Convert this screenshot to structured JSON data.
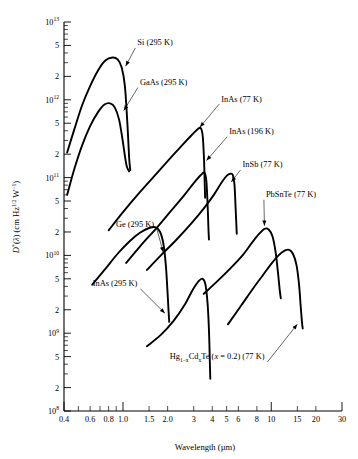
{
  "chart_data": {
    "type": "line",
    "title": "",
    "xlabel": "Wavelength (µm)",
    "ylabel": "D*(λ) (cm Hz^1/2 W^−1)",
    "xscale": "log",
    "yscale": "log",
    "xlim": [
      0.4,
      30
    ],
    "ylim": [
      100000000.0,
      10000000000000.0
    ],
    "grid": false,
    "legend_position": "inline-annotations",
    "xticks": [
      {
        "value": 0.4,
        "label": "0.4",
        "major": true
      },
      {
        "value": 0.5,
        "label": "",
        "major": false
      },
      {
        "value": 0.6,
        "label": "0.6",
        "major": true
      },
      {
        "value": 0.7,
        "label": "",
        "major": false
      },
      {
        "value": 0.8,
        "label": "0.8",
        "major": true
      },
      {
        "value": 0.9,
        "label": "",
        "major": false
      },
      {
        "value": 1.0,
        "label": "1.0",
        "major": true
      },
      {
        "value": 1.5,
        "label": "1.5",
        "major": true
      },
      {
        "value": 2.0,
        "label": "2.0",
        "major": true
      },
      {
        "value": 3,
        "label": "3",
        "major": true
      },
      {
        "value": 4,
        "label": "4",
        "major": true
      },
      {
        "value": 5,
        "label": "5",
        "major": true
      },
      {
        "value": 6,
        "label": "6",
        "major": true
      },
      {
        "value": 8,
        "label": "8",
        "major": true
      },
      {
        "value": 10,
        "label": "10",
        "major": true
      },
      {
        "value": 15,
        "label": "15",
        "major": true
      },
      {
        "value": 20,
        "label": "20",
        "major": true
      },
      {
        "value": 30,
        "label": "30",
        "major": true
      }
    ],
    "yticks": [
      {
        "value": 10000000000000.0,
        "label": "10¹³",
        "mantissa": "10",
        "exponent": "13",
        "major": true
      },
      {
        "value": 5000000000000.0,
        "label": "5",
        "major": true
      },
      {
        "value": 2000000000000.0,
        "label": "2",
        "major": true
      },
      {
        "value": 1000000000000.0,
        "label": "10¹²",
        "mantissa": "10",
        "exponent": "12",
        "major": true
      },
      {
        "value": 500000000000.0,
        "label": "5",
        "major": true
      },
      {
        "value": 200000000000.0,
        "label": "2",
        "major": true
      },
      {
        "value": 100000000000.0,
        "label": "10¹¹",
        "mantissa": "10",
        "exponent": "11",
        "major": true
      },
      {
        "value": 50000000000.0,
        "label": "5",
        "major": true
      },
      {
        "value": 20000000000.0,
        "label": "2",
        "major": true
      },
      {
        "value": 10000000000.0,
        "label": "10¹⁰",
        "mantissa": "10",
        "exponent": "10",
        "major": true
      },
      {
        "value": 5000000000.0,
        "label": "5",
        "major": true
      },
      {
        "value": 2000000000.0,
        "label": "2",
        "major": true
      },
      {
        "value": 1000000000.0,
        "label": "10⁹",
        "mantissa": "10",
        "exponent": "9",
        "major": true
      },
      {
        "value": 500000000.0,
        "label": "5",
        "major": true
      },
      {
        "value": 200000000.0,
        "label": "2",
        "major": true
      },
      {
        "value": 100000000.0,
        "label": "10⁸",
        "mantissa": "10",
        "exponent": "8",
        "major": true
      }
    ],
    "series": [
      {
        "name": "Si (295 K)",
        "label": "Si (295 K)",
        "label_pos": {
          "x": 1.25,
          "y": 5000000000000.0
        },
        "arrow_to": {
          "x": 1.03,
          "y": 2600000000000.0
        },
        "points": [
          [
            0.42,
            210000000000.0
          ],
          [
            0.47,
            420000000000.0
          ],
          [
            0.53,
            850000000000.0
          ],
          [
            0.6,
            1500000000000.0
          ],
          [
            0.68,
            2400000000000.0
          ],
          [
            0.76,
            3200000000000.0
          ],
          [
            0.85,
            3500000000000.0
          ],
          [
            0.92,
            3300000000000.0
          ],
          [
            0.98,
            2600000000000.0
          ],
          [
            1.03,
            1500000000000.0
          ],
          [
            1.07,
            500000000000.0
          ],
          [
            1.1,
            180000000000.0
          ],
          [
            1.12,
            125000000000.0
          ]
        ]
      },
      {
        "name": "GaAs (295 K)",
        "label": "GaAs (295 K)",
        "label_pos": {
          "x": 1.3,
          "y": 1550000000000.0
        },
        "arrow_to": {
          "x": 1.0,
          "y": 700000000000.0
        },
        "points": [
          [
            0.42,
            60000000000.0
          ],
          [
            0.47,
            130000000000.0
          ],
          [
            0.53,
            260000000000.0
          ],
          [
            0.6,
            460000000000.0
          ],
          [
            0.68,
            700000000000.0
          ],
          [
            0.75,
            870000000000.0
          ],
          [
            0.82,
            900000000000.0
          ],
          [
            0.88,
            800000000000.0
          ],
          [
            0.94,
            560000000000.0
          ],
          [
            0.99,
            320000000000.0
          ],
          [
            1.03,
            190000000000.0
          ],
          [
            1.06,
            140000000000.0
          ],
          [
            1.1,
            120000000000.0
          ]
        ]
      },
      {
        "name": "InAs (77 K)",
        "label": "InAs (77 K)",
        "label_pos": {
          "x": 4.6,
          "y": 950000000000.0
        },
        "arrow_to": {
          "x": 3.25,
          "y": 430000000000.0
        },
        "points": [
          [
            0.8,
            21000000000.0
          ],
          [
            1.0,
            36000000000.0
          ],
          [
            1.3,
            65000000000.0
          ],
          [
            1.7,
            115000000000.0
          ],
          [
            2.1,
            180000000000.0
          ],
          [
            2.5,
            260000000000.0
          ],
          [
            2.9,
            350000000000.0
          ],
          [
            3.2,
            420000000000.0
          ],
          [
            3.35,
            430000000000.0
          ],
          [
            3.45,
            340000000000.0
          ],
          [
            3.52,
            170000000000.0
          ],
          [
            3.56,
            80000000000.0
          ],
          [
            3.58,
            55000000000.0
          ]
        ]
      },
      {
        "name": "InAs (196 K)",
        "label": "InAs (196 K)",
        "label_pos": {
          "x": 5.2,
          "y": 360000000000.0
        },
        "arrow_to": {
          "x": 3.6,
          "y": 160000000000.0
        },
        "points": [
          [
            1.05,
            8000000000.0
          ],
          [
            1.3,
            13000000000.0
          ],
          [
            1.7,
            23000000000.0
          ],
          [
            2.1,
            37000000000.0
          ],
          [
            2.6,
            60000000000.0
          ],
          [
            3.0,
            85000000000.0
          ],
          [
            3.35,
            108000000000.0
          ],
          [
            3.55,
            115000000000.0
          ],
          [
            3.65,
            90000000000.0
          ],
          [
            3.72,
            45000000000.0
          ],
          [
            3.77,
            22000000000.0
          ],
          [
            3.8,
            16000000000.0
          ]
        ]
      },
      {
        "name": "InSb (77 K)",
        "label": "InSb (77 K)",
        "label_pos": {
          "x": 6.4,
          "y": 135000000000.0
        },
        "arrow_to": {
          "x": 5.3,
          "y": 85000000000.0
        },
        "points": [
          [
            1.45,
            6500000000.0
          ],
          [
            1.8,
            10000000000.0
          ],
          [
            2.3,
            16000000000.0
          ],
          [
            2.9,
            26000000000.0
          ],
          [
            3.5,
            40000000000.0
          ],
          [
            4.1,
            60000000000.0
          ],
          [
            4.6,
            85000000000.0
          ],
          [
            5.0,
            105000000000.0
          ],
          [
            5.3,
            112000000000.0
          ],
          [
            5.5,
            108000000000.0
          ],
          [
            5.65,
            80000000000.0
          ],
          [
            5.75,
            40000000000.0
          ],
          [
            5.82,
            24000000000.0
          ],
          [
            5.85,
            19000000000.0
          ]
        ]
      },
      {
        "name": "PbSnTe (77 K)",
        "label": "PbSnTe (77 K)",
        "label_pos": {
          "x": 9.2,
          "y": 56000000000.0
        },
        "arrow_to": {
          "x": 9.0,
          "y": 23000000000.0
        },
        "points": [
          [
            3.5,
            3200000000.0
          ],
          [
            4.3,
            4600000000.0
          ],
          [
            5.3,
            6800000000.0
          ],
          [
            6.4,
            10000000000.0
          ],
          [
            7.4,
            14500000000.0
          ],
          [
            8.3,
            19000000000.0
          ],
          [
            9.0,
            22000000000.0
          ],
          [
            9.6,
            21500000000.0
          ],
          [
            10.2,
            17500000000.0
          ],
          [
            10.7,
            11000000000.0
          ],
          [
            11.1,
            6000000000.0
          ],
          [
            11.4,
            3600000000.0
          ],
          [
            11.6,
            2800000000.0
          ]
        ]
      },
      {
        "name": "Ge (295 K)",
        "label": "Ge (295 K)",
        "label_pos": {
          "x": 1.62,
          "y": 23000000000.0
        },
        "arrow_to": {
          "x": 1.88,
          "y": 10500000000.0
        },
        "points": [
          [
            0.62,
            4200000000.0
          ],
          [
            0.75,
            6500000000.0
          ],
          [
            0.92,
            10500000000.0
          ],
          [
            1.1,
            15000000000.0
          ],
          [
            1.3,
            19500000000.0
          ],
          [
            1.5,
            22500000000.0
          ],
          [
            1.65,
            23000000000.0
          ],
          [
            1.78,
            20000000000.0
          ],
          [
            1.88,
            13500000000.0
          ],
          [
            1.95,
            7000000000.0
          ],
          [
            2.0,
            3200000000.0
          ],
          [
            2.03,
            1900000000.0
          ],
          [
            2.05,
            1400000000.0
          ]
        ]
      },
      {
        "name": "InAs (295 K)",
        "label": "InAs (295 K)",
        "label_pos": {
          "x": 1.25,
          "y": 4000000000.0
        },
        "arrow_to": {
          "x": 1.95,
          "y": 1750000000.0
        },
        "points": [
          [
            1.45,
            680000000.0
          ],
          [
            1.8,
            950000000.0
          ],
          [
            2.2,
            1450000000.0
          ],
          [
            2.6,
            2300000000.0
          ],
          [
            2.95,
            3600000000.0
          ],
          [
            3.25,
            4700000000.0
          ],
          [
            3.45,
            5000000000.0
          ],
          [
            3.6,
            4200000000.0
          ],
          [
            3.72,
            2400000000.0
          ],
          [
            3.8,
            1100000000.0
          ],
          [
            3.85,
            450000000.0
          ],
          [
            3.88,
            260000000.0
          ]
        ]
      },
      {
        "name": "Hg1-xCdxTe (x = 0.2) (77 K)",
        "label": "Hg₁₋ₓCdₓTe (x = 0.2) (77 K)",
        "label_pos": {
          "x": 9.0,
          "y": 460000000.0
        },
        "arrow_to": {
          "x": 15.2,
          "y": 1350000000.0
        },
        "points": [
          [
            5.1,
            1300000000.0
          ],
          [
            6.2,
            2200000000.0
          ],
          [
            7.5,
            3700000000.0
          ],
          [
            8.8,
            5600000000.0
          ],
          [
            10.0,
            7800000000.0
          ],
          [
            11.2,
            10000000000.0
          ],
          [
            12.3,
            11500000000.0
          ],
          [
            13.2,
            11800000000.0
          ],
          [
            14.0,
            10500000000.0
          ],
          [
            14.8,
            7500000000.0
          ],
          [
            15.4,
            4200000000.0
          ],
          [
            15.8,
            2200000000.0
          ],
          [
            16.1,
            1400000000.0
          ],
          [
            16.3,
            1150000000.0
          ]
        ]
      }
    ]
  }
}
